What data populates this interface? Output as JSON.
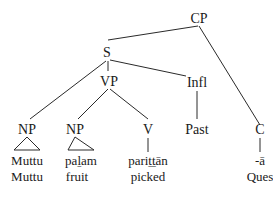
{
  "tree": {
    "nodes": {
      "cp": "CP",
      "s": "S",
      "vp": "VP",
      "infl": "Infl",
      "np_subject": "NP",
      "np_object": "NP",
      "v": "V",
      "past": "Past",
      "c": "C"
    },
    "leaves": {
      "subject": {
        "form": "Muttu",
        "gloss": "Muttu"
      },
      "object": {
        "form": "paḻam",
        "gloss": "fruit"
      },
      "verb": {
        "form": "pariṯṯān",
        "gloss": "picked"
      },
      "tense": {
        "form": "Past"
      },
      "complementizer": {
        "form": "-ā",
        "gloss": "Ques"
      }
    }
  }
}
